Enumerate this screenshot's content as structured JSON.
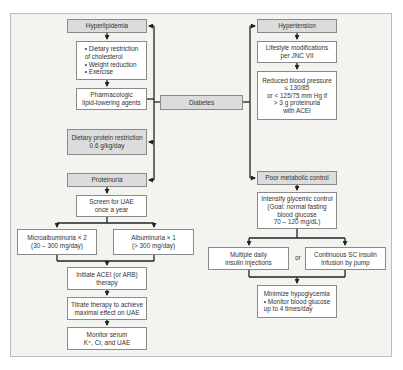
{
  "diagram": {
    "center": {
      "label": "Diabetes"
    },
    "left_branch": {
      "hyperlipidemia": {
        "label": "Hyperlipidemia",
        "lifestyle_items": [
          "Dietary restriction\n  of cholesterol",
          "Weight reduction",
          "Exercise"
        ],
        "lifestyle_text": "• Dietary restriction\n   of cholesterol\n• Weight reduction\n• Exercise",
        "therapy": "Pharmacologic\nlipid-lowering agents"
      },
      "dietary_protein": "Dietary protein restriction\n0.6 g/kg/day",
      "proteinuria": {
        "label": "Proteinuria",
        "screen": "Screen for UAE\nonce a year",
        "microalbuminuria": "Microalbuminuria × 2\n(30 – 300 mg/day)",
        "albuminuria": "Albuminuria × 1\n(> 300 mg/day)",
        "initiate": "Initiate ACEI (or ARB)\ntherapy",
        "titrate": "Titrate therapy to achieve\nmaximal effect on UAE",
        "monitor": "Monitor serum\nK⁺, Cr, and UAE"
      }
    },
    "right_branch": {
      "hypertension": {
        "label": "Hypertension",
        "lifestyle": "Lifestyle modifications\nper JNC VII",
        "target": "Reduced blood pressure\n≤ 130/85\nor < 125/75 mm Hg if\n> 3 g proteinuria\nwith ACEI"
      },
      "poor_metabolic_control": {
        "label": "Poor metabolic control",
        "intensify": "Intensify glycemic control\n(Goal: normal fasting\nblood glucose\n70 – 120 mg/dL)",
        "option_a": "Multiple daily\ninsulin injections",
        "or_label": "or",
        "option_b": "Continuous SC insulin\ninfusion by pump",
        "minimize": "Minimize hypoglycemia\n• Monitor blood glucose\n   up to 4 times/day"
      }
    }
  },
  "colors": {
    "header_box": "#dcdcdc",
    "box": "#ffffff",
    "background": "#f3f3f0",
    "line": "#222222"
  }
}
